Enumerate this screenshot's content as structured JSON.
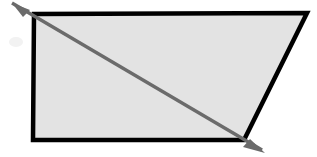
{
  "figure": {
    "canvas": {
      "width": 317,
      "height": 157,
      "background_color": "#ffffff"
    },
    "shape": {
      "name": "trapezoid",
      "kind": "quadrilateral",
      "fill_color": "#e3e3e3",
      "stroke_color": "#000000",
      "stroke_width": 4.5,
      "points": "34,14 307,13 244,140 33,140",
      "vertices": [
        {
          "label": "top-left",
          "x": 34,
          "y": 14
        },
        {
          "label": "top-right",
          "x": 307,
          "y": 13
        },
        {
          "label": "bottom-right",
          "x": 244,
          "y": 140
        },
        {
          "label": "bottom-left",
          "x": 33,
          "y": 140
        }
      ]
    },
    "arrow": {
      "name": "diagonal-double-arrow",
      "stroke_color": "#6b6b6b",
      "stroke_width": 3.4,
      "start": {
        "x": 12,
        "y": 3
      },
      "end": {
        "x": 262,
        "y": 150
      },
      "head_start": "12,3 30,10 23,17",
      "head_end": "265,153 243,147 250,139",
      "head_fill": "#6b6b6b",
      "double_headed": true
    },
    "smudge": {
      "name": "scan-smudge",
      "x": 16,
      "y": 42,
      "rx": 7,
      "ry": 5,
      "color": "#f2f2f2"
    },
    "smudge2": {
      "name": "scan-smudge-secondary",
      "x": 103,
      "y": 62,
      "rx": 3,
      "ry": 2,
      "color": "#d6d6d6"
    }
  }
}
